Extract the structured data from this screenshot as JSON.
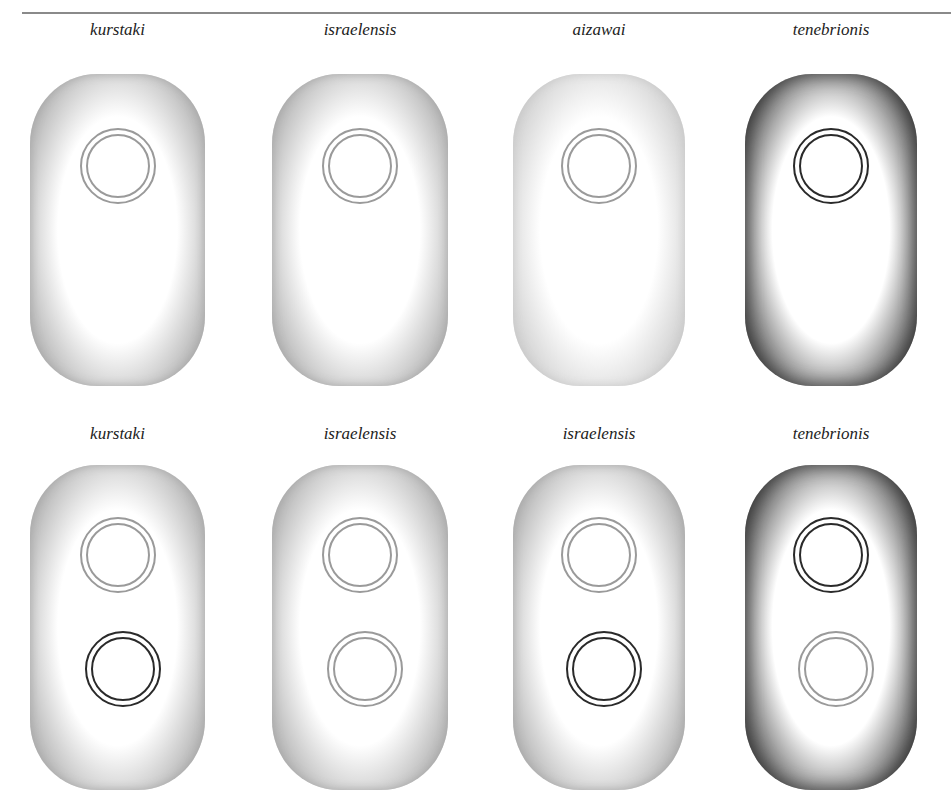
{
  "figure": {
    "rows": [
      {
        "cells": [
          {
            "label": "kurstaki",
            "tone": "medium",
            "rings": [
              "light"
            ]
          },
          {
            "label": "israelensis",
            "tone": "medium",
            "rings": [
              "light"
            ]
          },
          {
            "label": "aizawai",
            "tone": "light",
            "rings": [
              "light"
            ]
          },
          {
            "label": "tenebrionis",
            "tone": "dark",
            "rings": [
              "dark"
            ]
          }
        ]
      },
      {
        "cells": [
          {
            "label": "kurstaki",
            "tone": "medium",
            "rings": [
              "light",
              "dark"
            ]
          },
          {
            "label": "israelensis",
            "tone": "medium",
            "rings": [
              "light",
              "light"
            ]
          },
          {
            "label": "israelensis",
            "tone": "medium",
            "rings": [
              "light",
              "dark"
            ]
          },
          {
            "label": "tenebrionis",
            "tone": "dark",
            "rings": [
              "dark",
              "light"
            ]
          }
        ]
      }
    ],
    "colors": {
      "ring_light": "#9a9a9a",
      "ring_dark": "#2a2a2a",
      "edge_light": "#c8c8c8",
      "edge_medium": "#a8a8a8",
      "edge_dark": "#3a3a3a"
    }
  }
}
